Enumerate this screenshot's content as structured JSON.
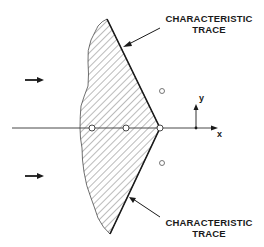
{
  "diagram": {
    "labels": {
      "top_trace_line1": "CHARACTERISTIC",
      "top_trace_line2": "TRACE",
      "bottom_trace_line1": "CHARACTERISTIC",
      "bottom_trace_line2": "TRACE",
      "axis_x": "x",
      "axis_y": "y"
    },
    "colors": {
      "ink": "#1a1a1a",
      "background": "#ffffff"
    },
    "flow_arrows": [
      {
        "x1": 25,
        "y1": 80,
        "x2": 44,
        "y2": 80
      },
      {
        "x1": 25,
        "y1": 176,
        "x2": 44,
        "y2": 176
      }
    ],
    "points_on_axis": [
      {
        "cx": 92,
        "cy": 128
      },
      {
        "cx": 126,
        "cy": 128
      },
      {
        "cx": 160,
        "cy": 128
      }
    ],
    "points_off_axis": [
      {
        "cx": 162,
        "cy": 91
      },
      {
        "cx": 162,
        "cy": 163
      }
    ]
  }
}
